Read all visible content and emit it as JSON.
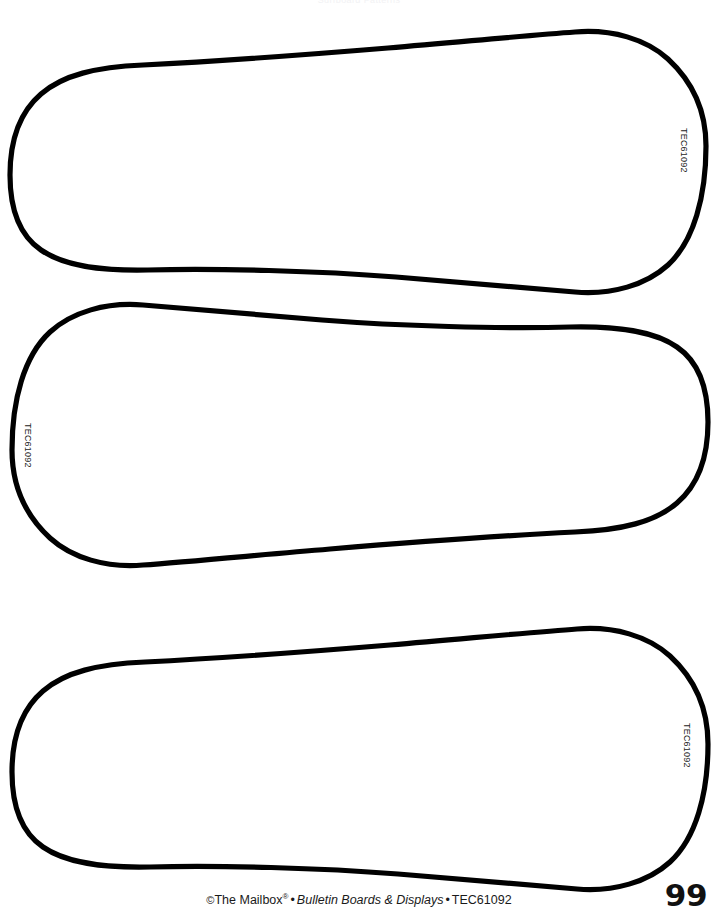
{
  "page": {
    "width": 718,
    "height": 917,
    "background_color": "#ffffff",
    "ink_color": "#000000",
    "page_number": "99",
    "cropped_header_text": "Surfboard Patterns"
  },
  "footer": {
    "copyright_symbol": "©",
    "publisher": "The Mailbox",
    "registered_mark": "®",
    "separator": "•",
    "series_title": "Bulletin Boards & Displays",
    "product_code": "TEC61092"
  },
  "patterns": [
    {
      "id": "surfboard-top",
      "name": "surfboard-pattern-1",
      "code_label": "TEC61092",
      "nose_side": "left",
      "tail_side": "right",
      "code_x": 689,
      "code_y": 128,
      "path": "M 706 146 C 706 196 694 241 668 265 C 646 285 612 295 575 292 C 533 289 470 283 396 277 C 320 271 216 268 148 270 C 100 271 64 266 41 250 C 19 235 10 209 10 175 C 10 140 20 112 41 94 C 63 75 96 67 143 65 C 203 62 303 55 388 48 C 470 41 533 35 575 32 C 612 29 646 39 668 59 C 694 83 706 112 706 146 Z"
    },
    {
      "id": "surfboard-middle",
      "name": "surfboard-pattern-2",
      "code_label": "TEC61092",
      "nose_side": "right",
      "tail_side": "left",
      "code_x": 33,
      "code_y": 423,
      "path": "M 12 450 C 12 400 24 356 50 332 C 72 312 106 302 143 305 C 185 308 248 314 322 320 C 398 326 502 329 570 327 C 618 326 654 331 677 347 C 699 362 708 388 708 422 C 708 457 698 485 677 503 C 655 522 622 530 575 532 C 515 535 415 542 330 549 C 248 556 185 562 143 565 C 106 568 72 558 50 538 C 24 514 12 484 12 450 Z"
    },
    {
      "id": "surfboard-bottom",
      "name": "surfboard-pattern-3",
      "code_label": "TEC61092",
      "nose_side": "left",
      "tail_side": "right",
      "code_x": 692,
      "code_y": 723,
      "path": "M 708 744 C 708 794 696 838 670 862 C 648 882 614 892 577 889 C 535 886 472 880 398 874 C 322 868 218 865 150 867 C 102 868 66 863 43 847 C 21 832 12 806 12 772 C 12 737 22 709 43 691 C 65 672 98 664 145 662 C 205 659 305 652 390 645 C 472 638 535 632 577 629 C 614 626 648 636 670 656 C 696 680 708 710 708 744 Z"
    }
  ]
}
